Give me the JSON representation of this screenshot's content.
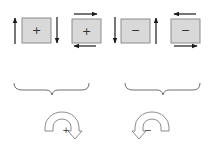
{
  "colors": {
    "box_fill": "#d9d9d9",
    "box_stroke": "#8c8c8c",
    "arrow": "#1a1a1a",
    "brace": "#707070",
    "curved_arrow_stroke": "#8c8c8c"
  },
  "boxes": [
    {
      "id": "box-1",
      "sign": "+",
      "arrows": "vertical: left up, right down"
    },
    {
      "id": "box-2",
      "sign": "+",
      "arrows": "horizontal: top right, bottom left"
    },
    {
      "id": "box-3",
      "sign": "−",
      "arrows": "vertical: left down, right up"
    },
    {
      "id": "box-4",
      "sign": "−",
      "arrows": "horizontal: top left, bottom right"
    }
  ],
  "braces": [
    {
      "id": "brace-positive",
      "spans": [
        "box-1",
        "box-2"
      ]
    },
    {
      "id": "brace-negative",
      "spans": [
        "box-3",
        "box-4"
      ]
    }
  ],
  "rotations": [
    {
      "id": "rotation-positive",
      "sign": "+",
      "direction": "clockwise"
    },
    {
      "id": "rotation-negative",
      "sign": "−",
      "direction": "counterclockwise"
    }
  ]
}
